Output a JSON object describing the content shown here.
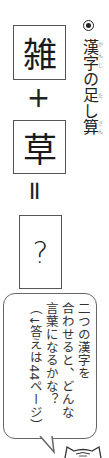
{
  "equation": {
    "term1": "雑",
    "plus": "+",
    "term2": "草",
    "equals": "=",
    "answer": "?"
  },
  "title": {
    "bullet": "◉",
    "text": "漢字の足し算",
    "parts": [
      {
        "base": "漢字",
        "ruby": "かんじ"
      },
      {
        "base": "の",
        "ruby": ""
      },
      {
        "base": "足",
        "ruby": "た"
      },
      {
        "base": "し",
        "ruby": ""
      },
      {
        "base": "算",
        "ruby": "ざん"
      }
    ]
  },
  "bubble": {
    "line1": "二つの漢字を",
    "line2": "合わせると、どんな",
    "line3": "言葉になるかな？",
    "line4": "（↓答えは44ページ）",
    "ruby": {
      "二": "ふた",
      "漢字": "かんじ",
      "合": "あ",
      "言葉": "ことば",
      "答": "こた"
    }
  },
  "colors": {
    "border": "#555555",
    "text": "#1a1a1a",
    "ruby": "#888888"
  }
}
